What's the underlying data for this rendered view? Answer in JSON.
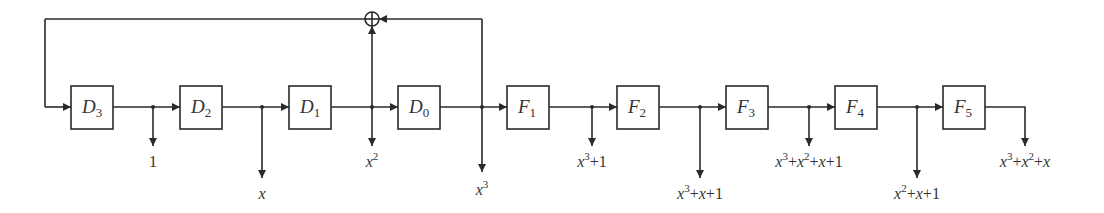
{
  "diagram": {
    "type": "shift-register / lfsr block diagram",
    "registers": [
      {
        "id": "D3",
        "letter": "D",
        "sub": "3"
      },
      {
        "id": "D2",
        "letter": "D",
        "sub": "2"
      },
      {
        "id": "D1",
        "letter": "D",
        "sub": "1"
      },
      {
        "id": "D0",
        "letter": "D",
        "sub": "0"
      }
    ],
    "stages": [
      {
        "id": "F1",
        "letter": "F",
        "sub": "1"
      },
      {
        "id": "F2",
        "letter": "F",
        "sub": "2"
      },
      {
        "id": "F3",
        "letter": "F",
        "sub": "3"
      },
      {
        "id": "F4",
        "letter": "F",
        "sub": "4"
      },
      {
        "id": "F5",
        "letter": "F",
        "sub": "5"
      }
    ],
    "xor_symbol": "⊕",
    "taps": [
      {
        "after": "D3",
        "label": "1",
        "parts": [
          {
            "t": "1",
            "n": true
          }
        ]
      },
      {
        "after": "D2",
        "label": "x",
        "parts": [
          {
            "t": "x"
          }
        ]
      },
      {
        "after": "D1",
        "label": "x^2",
        "parts": [
          {
            "t": "x"
          },
          {
            "t": "2",
            "sup": true
          }
        ]
      },
      {
        "after": "D0",
        "label": "x^3",
        "parts": [
          {
            "t": "x"
          },
          {
            "t": "3",
            "sup": true
          }
        ]
      },
      {
        "after": "F1",
        "label": "x^3+1",
        "parts": [
          {
            "t": "x"
          },
          {
            "t": "3",
            "sup": true
          },
          {
            "t": "+1",
            "n": true
          }
        ]
      },
      {
        "after": "F2",
        "label": "x^3+x+1",
        "parts": [
          {
            "t": "x"
          },
          {
            "t": "3",
            "sup": true
          },
          {
            "t": "+",
            "n": true
          },
          {
            "t": "x"
          },
          {
            "t": "+1",
            "n": true
          }
        ]
      },
      {
        "after": "F3",
        "label": "x^3+x^2+x+1",
        "parts": [
          {
            "t": "x"
          },
          {
            "t": "3",
            "sup": true
          },
          {
            "t": "+",
            "n": true
          },
          {
            "t": "x"
          },
          {
            "t": "2",
            "sup": true
          },
          {
            "t": "+",
            "n": true
          },
          {
            "t": "x"
          },
          {
            "t": "+1",
            "n": true
          }
        ]
      },
      {
        "after": "F4",
        "label": "x^2+x+1",
        "parts": [
          {
            "t": "x"
          },
          {
            "t": "2",
            "sup": true
          },
          {
            "t": "+",
            "n": true
          },
          {
            "t": "x"
          },
          {
            "t": "+1",
            "n": true
          }
        ]
      },
      {
        "after": "F5",
        "label": "x^3+x^2+x",
        "parts": [
          {
            "t": "x"
          },
          {
            "t": "3",
            "sup": true
          },
          {
            "t": "+",
            "n": true
          },
          {
            "t": "x"
          },
          {
            "t": "2",
            "sup": true
          },
          {
            "t": "+",
            "n": true
          },
          {
            "t": "x"
          }
        ]
      }
    ],
    "feedback": {
      "xor_inputs": [
        "x^2 (after D1)",
        "x^3 (after D0)"
      ],
      "xor_output_to": "D3"
    },
    "colors": {
      "stroke": "#2a2a2a",
      "text": "#333333",
      "background": "#ffffff"
    }
  }
}
